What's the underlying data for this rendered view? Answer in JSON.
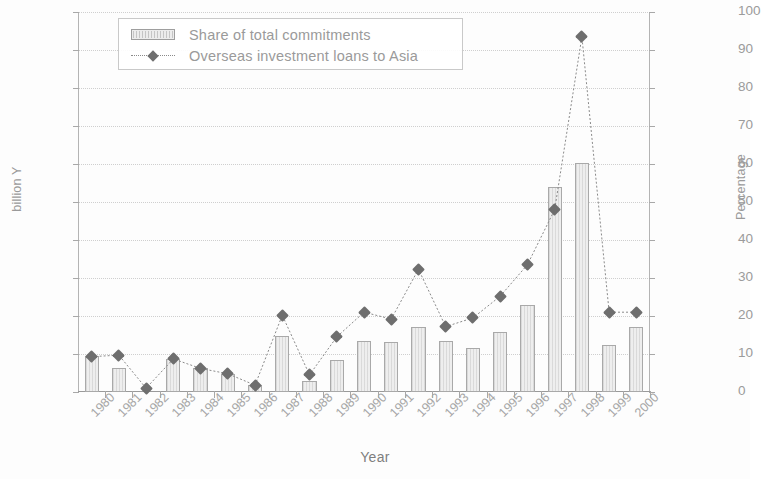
{
  "chart_data": {
    "type": "bar",
    "title": "",
    "subtitle": "",
    "xlabel": "Year",
    "ylabel": "billion Y",
    "y2label": "Percentage",
    "grid": true,
    "legend_position": "top-left",
    "categories": [
      "1980",
      "1981",
      "1982",
      "1983",
      "1984",
      "1985",
      "1986",
      "1987",
      "1988",
      "1989",
      "1990",
      "1991",
      "1992",
      "1993",
      "1994",
      "1995",
      "1996",
      "1997",
      "1998",
      "1999",
      "2000"
    ],
    "ylim": [
      0,
      1000
    ],
    "y2lim": [
      0,
      100
    ],
    "yticks": [
      "0",
      "100",
      "200",
      "300",
      "400",
      "500",
      "600",
      "700",
      "800",
      "900",
      "1.000"
    ],
    "ytick_values": [
      0,
      100,
      200,
      300,
      400,
      500,
      600,
      700,
      800,
      900,
      1000
    ],
    "y2ticks": [
      "0",
      "10",
      "20",
      "30",
      "40",
      "50",
      "60",
      "70",
      "80",
      "90",
      "100"
    ],
    "y2tick_values": [
      0,
      10,
      20,
      30,
      40,
      50,
      60,
      70,
      80,
      90,
      100
    ],
    "series": [
      {
        "name": "Share of total commitments",
        "type": "bar",
        "axis": "left",
        "units": "billion Y",
        "color": "#eeeeee",
        "edge_color": "#a9a9a9",
        "values": [
          95,
          62,
          0,
          88,
          62,
          48,
          18,
          148,
          30,
          85,
          133,
          132,
          172,
          135,
          115,
          158,
          228,
          540,
          602,
          125,
          172
        ]
      },
      {
        "name": "Overseas investment loans to Asia",
        "type": "line",
        "axis": "right",
        "units": "percent",
        "color": "#6e6e6e",
        "marker": "diamond",
        "values": [
          9.3,
          9.7,
          1.0,
          8.7,
          6.2,
          4.8,
          1.8,
          20.2,
          4.5,
          14.5,
          21.0,
          19.2,
          32.3,
          17.2,
          19.5,
          25.2,
          33.5,
          48.0,
          93.5,
          21.0,
          21.0
        ]
      }
    ]
  },
  "legend": {
    "items": [
      {
        "label": "Share of total commitments",
        "swatch": "bar-swatch"
      },
      {
        "label": "Overseas investment loans to Asia",
        "swatch": "line-marker-swatch"
      }
    ]
  },
  "axes": {
    "left_title": "billion Y",
    "right_title": "Percentage",
    "bottom_title": "Year"
  },
  "colors": {
    "bar_fill": "#eeeeee",
    "bar_edge": "#a9a9a9",
    "line": "#8a8a8a",
    "marker": "#6e6e6e",
    "grid": "#cfcfcf",
    "axis": "#a8a8a8",
    "text": "#9a9a9a",
    "background": "#fdfdfd"
  }
}
